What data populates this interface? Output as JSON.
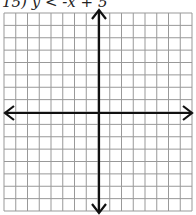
{
  "problem": {
    "label": "15) y < -x + 5"
  },
  "graph": {
    "grid_columns": 16,
    "grid_rows": 16,
    "x_axis": "horizontal axis with arrows",
    "y_axis": "vertical axis with arrows",
    "colors": {
      "grid": "#999999",
      "axis": "#111111"
    }
  }
}
